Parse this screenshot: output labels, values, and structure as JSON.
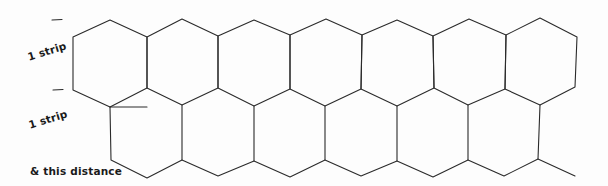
{
  "diagram": {
    "type": "hexagon-strip-layout",
    "stroke_color": "#2a2a2a",
    "background_color": "#fdfdfd",
    "labels": {
      "strip_top": "1 strip",
      "strip_bottom": "1 strip",
      "distance": "& this distance"
    },
    "rows": [
      {
        "name": "top-row",
        "hexagon_count": 7
      },
      {
        "name": "bottom-row",
        "hexagon_count": 6,
        "trailing_partial": true
      }
    ],
    "markers": [
      {
        "name": "strip-marker-top",
        "y": 20
      },
      {
        "name": "strip-marker-middle",
        "y": 90
      }
    ]
  }
}
